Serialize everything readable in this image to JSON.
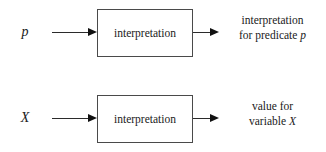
{
  "diagram": {
    "background_color": "#ffffff",
    "line_color": "#2b2b2b",
    "text_color": "#1a1a1a",
    "rows": [
      {
        "id": "predicate",
        "input_symbol": "p",
        "box_label": "interpretation",
        "output_line_1": "interpretation",
        "output_line_2_prefix": "for predicate",
        "output_line_2_symbol": "p",
        "in_arrow_icon": "arrow-right-icon",
        "out_arrow_icon": "arrow-right-icon"
      },
      {
        "id": "variable",
        "input_symbol": "X",
        "box_label": "interpretation",
        "output_line_1": "value for",
        "output_line_2_prefix": "variable",
        "output_line_2_symbol": "X",
        "in_arrow_icon": "arrow-right-icon",
        "out_arrow_icon": "arrow-right-icon"
      }
    ]
  }
}
